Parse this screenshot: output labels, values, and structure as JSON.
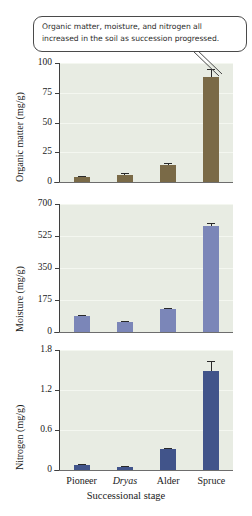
{
  "callout": {
    "text": "Organic matter, moisture, and nitrogen all increased in the soil as succession progressed."
  },
  "chart_data": [
    {
      "type": "bar",
      "title": "",
      "xlabel": "",
      "ylabel": "Organic matter (mg/g)",
      "categories": [
        "Pioneer",
        "Dryas",
        "Alder",
        "Spruce"
      ],
      "values": [
        4.0,
        6.0,
        14.0,
        88.0
      ],
      "errors": [
        1.0,
        1.5,
        2.0,
        7.0
      ],
      "ylim": [
        0,
        100
      ],
      "yticks": [
        0,
        25,
        50,
        75,
        100
      ],
      "ytick_labels": [
        "0",
        "25",
        "50",
        "75",
        "100"
      ],
      "bar_color": "#7a6a47",
      "grid": true,
      "legend": "none"
    },
    {
      "type": "bar",
      "title": "",
      "xlabel": "",
      "ylabel": "Moisture (mg/g)",
      "categories": [
        "Pioneer",
        "Dryas",
        "Alder",
        "Spruce"
      ],
      "values": [
        85.0,
        55.0,
        125.0,
        580.0
      ],
      "errors": [
        8.0,
        6.0,
        8.0,
        14.0
      ],
      "ylim": [
        0,
        700
      ],
      "yticks": [
        0,
        175,
        350,
        525,
        700
      ],
      "ytick_labels": [
        "0",
        "175",
        "350",
        "525",
        "700"
      ],
      "bar_color": "#7b86b8",
      "grid": true,
      "legend": "none"
    },
    {
      "type": "bar",
      "title": "",
      "xlabel": "Successional stage",
      "ylabel": "Nitrogen (mg/g)",
      "categories": [
        "Pioneer",
        "Dryas",
        "Alder",
        "Spruce"
      ],
      "values": [
        0.07,
        0.05,
        0.31,
        1.49
      ],
      "errors": [
        0.02,
        0.015,
        0.02,
        0.14
      ],
      "ylim": [
        0,
        1.8
      ],
      "yticks": [
        0,
        0.6,
        1.2,
        1.8
      ],
      "ytick_labels": [
        "0",
        "0.6",
        "1.2",
        "1.8"
      ],
      "bar_color": "#41548a",
      "grid": true,
      "legend": "none"
    }
  ],
  "axis": {
    "x_title": "Successional stage",
    "categories": [
      "Pioneer",
      "Dryas",
      "Alder",
      "Spruce"
    ],
    "italic_categories": [
      "Dryas"
    ]
  }
}
